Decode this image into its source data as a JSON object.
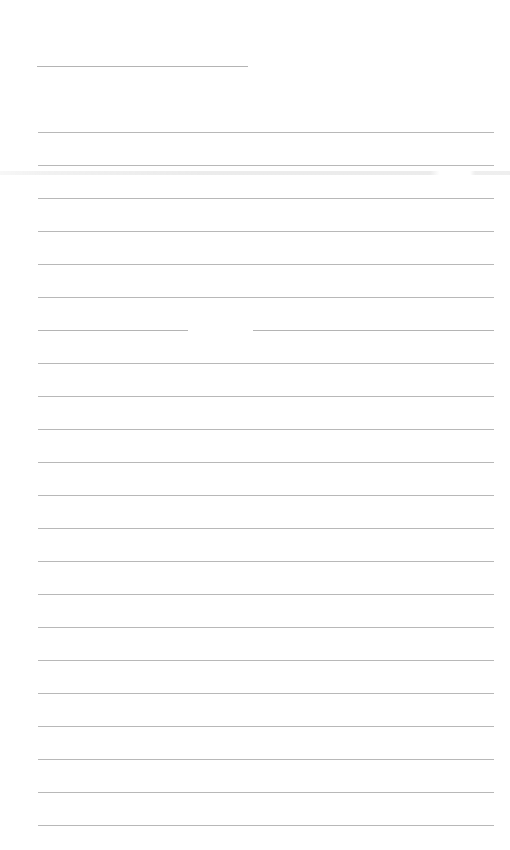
{
  "document": {
    "type": "lined-writing-sheet",
    "header_line": {
      "visible": true
    },
    "ruled_lines": {
      "count": 22,
      "first_y": 132,
      "spacing": 33,
      "broken_line_index": 6
    },
    "text_content": "",
    "colors": {
      "paper": "#ffffff",
      "rule": "#b8b8b8"
    }
  }
}
